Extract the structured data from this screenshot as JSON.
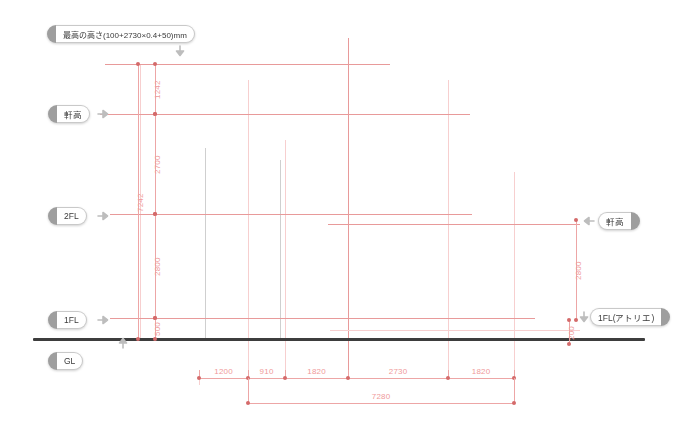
{
  "drawing": {
    "title": "建築断面図 - 高さ寸法",
    "ground_line_label": "GL"
  },
  "level_labels": [
    {
      "id": "max-height",
      "text": "最高の高さ(100+2730×0.4+50)mm",
      "side": "left",
      "x": 47,
      "y": 25,
      "wide": true
    },
    {
      "id": "eaves-height-left",
      "text": "軒高",
      "side": "left",
      "x": 48,
      "y": 105
    },
    {
      "id": "second-floor",
      "text": "2FL",
      "side": "left",
      "x": 48,
      "y": 207
    },
    {
      "id": "first-floor",
      "text": "1FL",
      "side": "left",
      "x": 48,
      "y": 311
    },
    {
      "id": "ground-level",
      "text": "GL",
      "side": "left",
      "x": 48,
      "y": 352
    },
    {
      "id": "eaves-height-right",
      "text": "軒高",
      "side": "right",
      "x": 598,
      "y": 212
    },
    {
      "id": "first-floor-atelier",
      "text": "1FL(アトリエ)",
      "side": "right",
      "x": 590,
      "y": 308
    }
  ],
  "vertical_dimensions_left": [
    {
      "value": "1242",
      "x": 155,
      "y_top": 64,
      "y_bottom": 114
    },
    {
      "value": "2700",
      "x": 155,
      "y_top": 114,
      "y_bottom": 214
    },
    {
      "value": "2800",
      "x": 155,
      "y_top": 214,
      "y_bottom": 318
    },
    {
      "value": "500",
      "x": 155,
      "y_top": 318,
      "y_bottom": 339
    },
    {
      "value": "7242",
      "x": 138,
      "y_top": 64,
      "y_bottom": 339
    }
  ],
  "vertical_dimensions_right": [
    {
      "value": "2800",
      "x": 576,
      "y_top": 220,
      "y_bottom": 320
    },
    {
      "value": "200",
      "x": 569,
      "y_top": 320,
      "y_bottom": 344
    }
  ],
  "horizontal_dimensions": {
    "segments": [
      {
        "value": "1200",
        "x_left": 199,
        "x_right": 248
      },
      {
        "value": "910",
        "x_left": 248,
        "x_right": 285
      },
      {
        "value": "1820",
        "x_left": 285,
        "x_right": 348
      },
      {
        "value": "2730",
        "x_left": 348,
        "x_right": 448
      },
      {
        "value": "1820",
        "x_left": 448,
        "x_right": 514
      }
    ],
    "total": {
      "value": "7280",
      "x_left": 248,
      "x_right": 514
    },
    "y_tick": 378,
    "y_total": 403
  },
  "level_lines": [
    {
      "name": "max-height-line",
      "y": 64,
      "x_left": 105,
      "x_right": 390,
      "weight": "strong"
    },
    {
      "name": "eaves-line",
      "y": 114,
      "x_left": 100,
      "x_right": 470,
      "weight": "strong"
    },
    {
      "name": "second-floor-line",
      "y": 214,
      "x_left": 110,
      "x_right": 472,
      "weight": "strong"
    },
    {
      "name": "eaves-right-line",
      "y": 224,
      "x_left": 328,
      "x_right": 580,
      "weight": "strong"
    },
    {
      "name": "first-floor-line",
      "y": 318,
      "x_left": 110,
      "x_right": 535,
      "weight": "strong"
    },
    {
      "name": "atelier-floor-line",
      "y": 330,
      "x_left": 330,
      "x_right": 580,
      "weight": "faint"
    }
  ],
  "structure_lines": [
    {
      "name": "column-line-1",
      "x": 205,
      "y_top": 148,
      "y_bottom": 340,
      "color": "gray"
    },
    {
      "name": "column-line-2",
      "x": 280,
      "y_top": 160,
      "y_bottom": 340,
      "color": "gray"
    },
    {
      "name": "grid-line-a",
      "x": 140,
      "y_top": 64,
      "y_bottom": 340,
      "color": "faint"
    },
    {
      "name": "grid-line-b",
      "x": 155,
      "y_top": 64,
      "y_bottom": 340,
      "color": "faint"
    },
    {
      "name": "grid-line-c",
      "x": 248,
      "y_top": 80,
      "y_bottom": 378,
      "color": "faint"
    },
    {
      "name": "grid-line-d",
      "x": 285,
      "y_top": 140,
      "y_bottom": 378,
      "color": "faint"
    },
    {
      "name": "grid-line-e",
      "x": 348,
      "y_top": 38,
      "y_bottom": 378,
      "color": "strong"
    },
    {
      "name": "grid-line-f",
      "x": 448,
      "y_top": 80,
      "y_bottom": 378,
      "color": "faint"
    },
    {
      "name": "grid-line-g",
      "x": 514,
      "y_top": 172,
      "y_bottom": 378,
      "color": "faint"
    },
    {
      "name": "grid-line-h",
      "x": 199,
      "y_top": 370,
      "y_bottom": 385,
      "color": "faint"
    }
  ],
  "ground_line": {
    "x_left": 33,
    "x_right": 645,
    "y": 338
  },
  "arrows": [
    {
      "name": "max-height-arrow",
      "x": 174,
      "y": 45,
      "dir": "down"
    },
    {
      "name": "eaves-left-arrow",
      "x": 97,
      "y": 108,
      "dir": "right"
    },
    {
      "name": "second-floor-arrow",
      "x": 97,
      "y": 210,
      "dir": "right"
    },
    {
      "name": "first-floor-arrow",
      "x": 97,
      "y": 314,
      "dir": "right"
    },
    {
      "name": "ground-level-arrow",
      "x": 117,
      "y": 337,
      "dir": "up"
    },
    {
      "name": "eaves-right-arrow",
      "x": 583,
      "y": 215,
      "dir": "left"
    },
    {
      "name": "atelier-arrow",
      "x": 578,
      "y": 311,
      "dir": "down"
    }
  ]
}
